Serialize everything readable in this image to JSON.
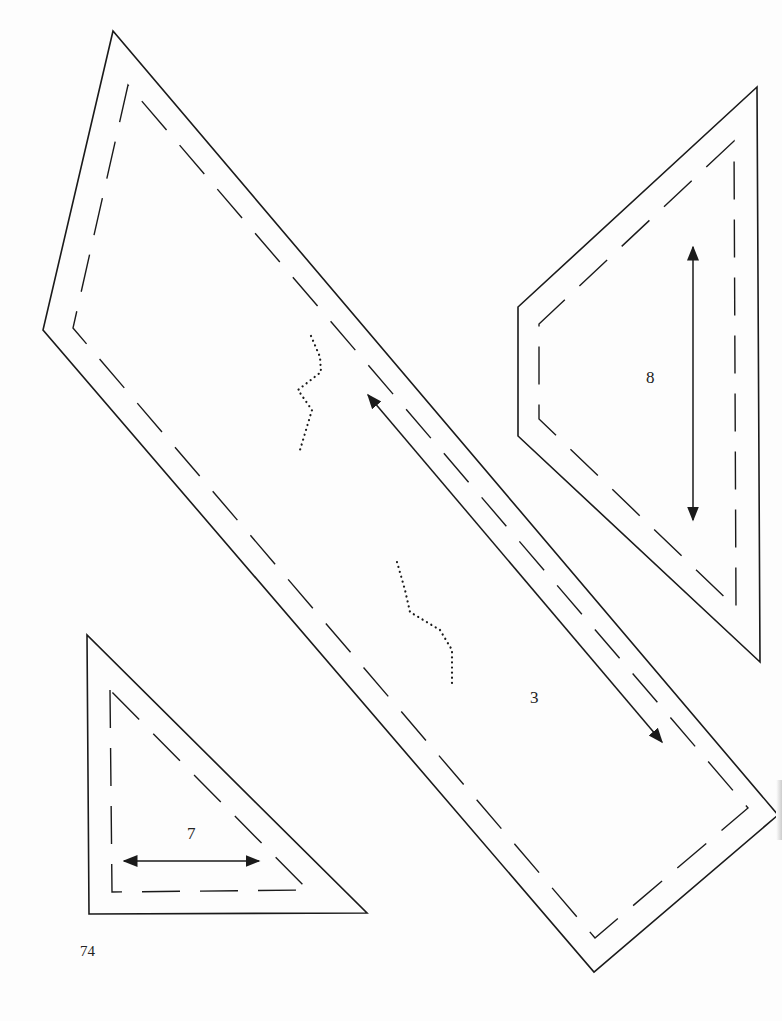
{
  "page": {
    "page_number": "74",
    "stroke_color": "#1a1a1a",
    "background": "#fdfdfd"
  },
  "templates": [
    {
      "id": "3",
      "label": "3",
      "outer": [
        [
          113,
          31
        ],
        [
          43,
          330
        ],
        [
          594,
          972
        ],
        [
          778,
          815
        ]
      ],
      "inner": [
        [
          128,
          85
        ],
        [
          73,
          328
        ],
        [
          595,
          938
        ],
        [
          748,
          808
        ]
      ],
      "grain_arrow": {
        "from": [
          368,
          395
        ],
        "to": [
          662,
          742
        ],
        "double": true
      },
      "label_pos": [
        535,
        700
      ],
      "dotted_curves": [
        [
          [
            311,
            336
          ],
          [
            320,
            357
          ],
          [
            321,
            372
          ],
          [
            298,
            390
          ],
          [
            312,
            410
          ],
          [
            300,
            450
          ]
        ],
        [
          [
            397,
            562
          ],
          [
            405,
            590
          ],
          [
            410,
            612
          ],
          [
            440,
            630
          ],
          [
            452,
            650
          ],
          [
            452,
            685
          ]
        ]
      ]
    },
    {
      "id": "8",
      "label": "8",
      "outer": [
        [
          757,
          87
        ],
        [
          518,
          307
        ],
        [
          518,
          436
        ],
        [
          760,
          662
        ]
      ],
      "inner": [
        [
          734,
          141
        ],
        [
          539,
          324
        ],
        [
          539,
          419
        ],
        [
          736,
          608
        ]
      ],
      "grain_arrow": {
        "from": [
          693,
          247
        ],
        "to": [
          693,
          520
        ],
        "double": true
      },
      "label_pos": [
        651,
        380
      ]
    },
    {
      "id": "7",
      "label": "7",
      "outer": [
        [
          87,
          635
        ],
        [
          89,
          914
        ],
        [
          367,
          913
        ]
      ],
      "inner": [
        [
          110,
          690
        ],
        [
          112,
          892
        ],
        [
          308,
          890
        ]
      ],
      "grain_arrow": {
        "from": [
          124,
          861
        ],
        "to": [
          259,
          861
        ],
        "double": true
      },
      "label_pos": [
        192,
        836
      ]
    }
  ]
}
